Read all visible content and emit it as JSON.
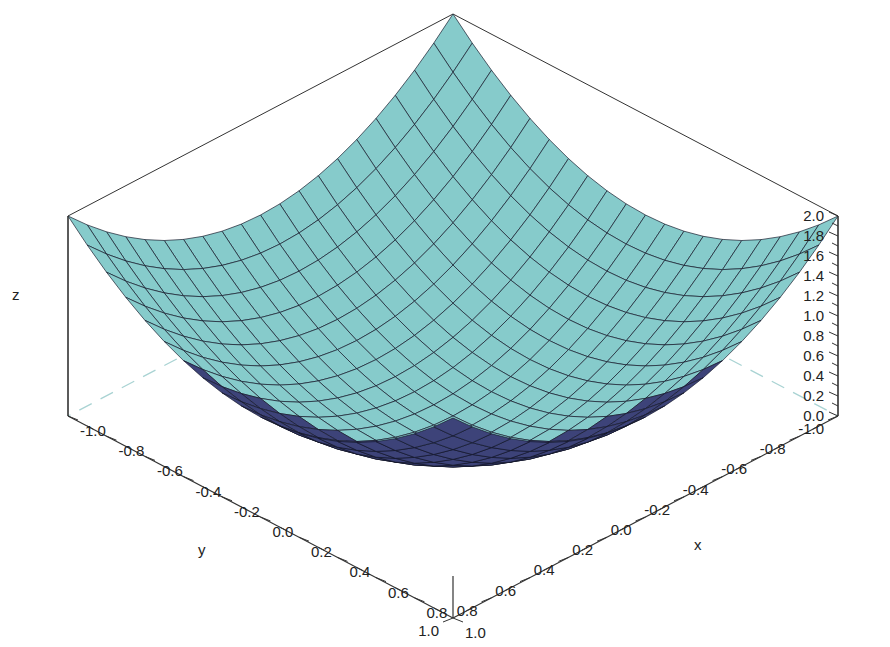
{
  "chart_data": {
    "type": "surface3d",
    "title": "",
    "function": "z = x^2 + y^2",
    "xlabel": "x",
    "ylabel": "y",
    "zlabel": "z",
    "xlim": [
      -1.0,
      1.0
    ],
    "ylim": [
      -1.0,
      1.0
    ],
    "zlim": [
      0.0,
      2.0
    ],
    "grid_divisions": 20,
    "x_ticks": [
      "-1.0",
      "-0.8",
      "-0.6",
      "-0.4",
      "-0.2",
      "0.0",
      "0.2",
      "0.4",
      "0.6",
      "0.8",
      "1.0"
    ],
    "y_ticks": [
      "-1.0",
      "-0.8",
      "-0.6",
      "-0.4",
      "-0.2",
      "0.0",
      "0.2",
      "0.4",
      "0.6",
      "0.8",
      "1.0"
    ],
    "z_ticks": [
      "0.0",
      "0.2",
      "0.4",
      "0.6",
      "0.8",
      "1.0",
      "1.2",
      "1.4",
      "1.6",
      "1.8",
      "2.0"
    ],
    "colors": {
      "surface_top": "#3d4379",
      "surface_bottom": "#86cbcb",
      "mesh_line": "#141628",
      "axis_line": "#333333",
      "back_dashed": "#a9d3d3"
    }
  }
}
